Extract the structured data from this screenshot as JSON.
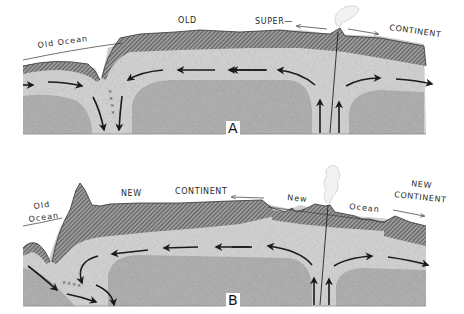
{
  "diagram": {
    "type": "geological cross-section",
    "panels": [
      {
        "id": "A",
        "letter": "A",
        "labels": {
          "old_ocean": "Old Ocean",
          "old": "OLD",
          "super": "SUPER—",
          "continent": "CONTINENT"
        }
      },
      {
        "id": "B",
        "letter": "B",
        "labels": {
          "old": "Old",
          "ocean_left": "Ocean",
          "new_continent_left_1": "NEW",
          "new_continent_left_2": "CONTINENT",
          "new_ocean_1": "New",
          "new_ocean_2": "Ocean",
          "new_continent_right_1": "NEW",
          "new_continent_right_2": "CONTINENT"
        }
      }
    ],
    "colors": {
      "crust_hatch": "#6a6a6a",
      "upper_mantle": "#d9d9d9",
      "lower_mantle": "#b8b8b8",
      "arrow": "#1a1a1a"
    }
  }
}
